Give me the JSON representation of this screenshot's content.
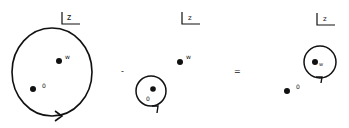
{
  "diagram": {
    "colors": {
      "ink": "#111111",
      "background": "#ffffff"
    },
    "operators": {
      "minus": "-",
      "equals": "="
    },
    "panels": [
      {
        "id": "panel-1",
        "plane_label": "z",
        "points": [
          {
            "label": "w"
          },
          {
            "label": "0"
          }
        ],
        "contour": "large loop enclosing w and 0, counterclockwise arrow at bottom"
      },
      {
        "id": "panel-2",
        "plane_label": "z",
        "points": [
          {
            "label": "w"
          },
          {
            "label": "0"
          }
        ],
        "contour": "small loop around 0"
      },
      {
        "id": "panel-3",
        "plane_label": "z",
        "points": [
          {
            "label": "w"
          },
          {
            "label": "0"
          }
        ],
        "contour": "small loop around w"
      }
    ]
  }
}
